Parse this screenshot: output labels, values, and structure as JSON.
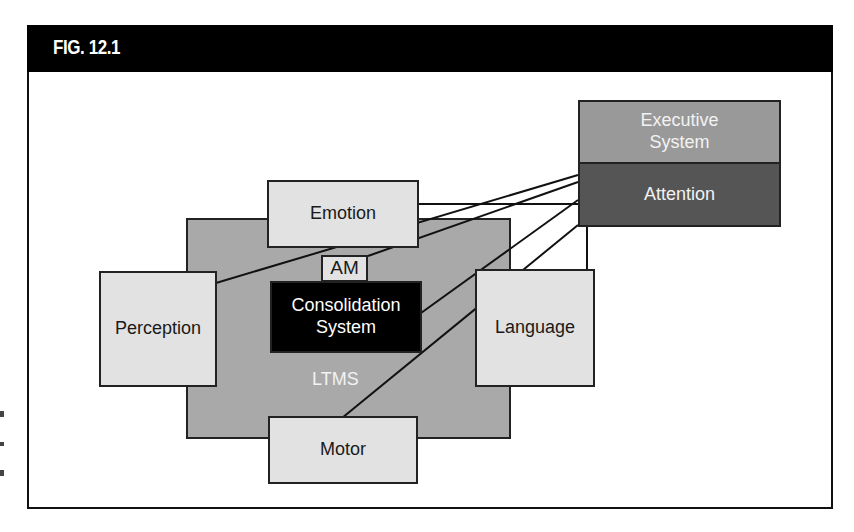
{
  "figure": {
    "title": "FIG. 12.1",
    "nodes": {
      "ltms": "LTMS",
      "emotion": "Emotion",
      "am": "AM",
      "consolidation": "Consolidation System",
      "consolidation_line1": "Consolidation",
      "consolidation_line2": "System",
      "perception": "Perception",
      "language": "Language",
      "motor": "Motor",
      "executive_line1": "Executive",
      "executive_line2": "System",
      "attention": "Attention"
    },
    "colors": {
      "title_bar": "#000000",
      "ltms_fill": "#a9a9a9",
      "module_fill": "#e2e2e2",
      "consolidation_fill": "#000000",
      "executive_fill": "#999999",
      "attention_fill": "#555555"
    },
    "connections": [
      {
        "from": "Attention",
        "to": "Perception"
      },
      {
        "from": "Attention",
        "to": "AM"
      },
      {
        "from": "Attention",
        "to": "Emotion"
      },
      {
        "from": "Attention",
        "to": "Consolidation System"
      },
      {
        "from": "Attention",
        "to": "Motor"
      },
      {
        "from": "Attention",
        "to": "Language"
      }
    ]
  }
}
